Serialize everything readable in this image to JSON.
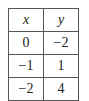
{
  "table": {
    "headers": [
      "x",
      "y"
    ],
    "rows": [
      [
        "0",
        "−2"
      ],
      [
        "−1",
        "1"
      ],
      [
        "−2",
        "4"
      ]
    ]
  }
}
